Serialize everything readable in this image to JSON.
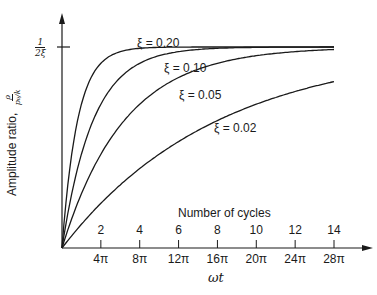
{
  "chart_data": {
    "type": "line",
    "title": "",
    "xlabel": "ωt",
    "x2label": "Number of cycles",
    "ylabel": "Amplitude ratio,",
    "ylabel_fraction": {
      "num": "ρ",
      "den": "p₀/k"
    },
    "ymax_label": {
      "num": "1",
      "den": "2ξ"
    },
    "x_ticks_cycles": [
      "2",
      "4",
      "6",
      "8",
      "10",
      "12",
      "14"
    ],
    "x_ticks_omega_t": [
      "4π",
      "8π",
      "12π",
      "16π",
      "20π",
      "24π",
      "28π"
    ],
    "x_range_cycles": [
      0,
      14
    ],
    "y_range_normalized": [
      0,
      1
    ],
    "grid": false,
    "legend": "inline labels",
    "formula": "ratio = (1/2ξ)(1 − e^(−ξωt))",
    "series": [
      {
        "name": "ξ = 0.20",
        "xi": 0.2,
        "cycles": [
          0,
          1,
          2,
          4,
          6,
          8,
          10,
          12,
          14
        ],
        "values_normalized": [
          0,
          0.72,
          0.92,
          0.99,
          1.0,
          1.0,
          1.0,
          1.0,
          1.0
        ]
      },
      {
        "name": "ξ = 0.10",
        "xi": 0.1,
        "cycles": [
          0,
          1,
          2,
          4,
          6,
          8,
          10,
          12,
          14
        ],
        "values_normalized": [
          0,
          0.47,
          0.72,
          0.92,
          0.98,
          0.99,
          1.0,
          1.0,
          1.0
        ]
      },
      {
        "name": "ξ = 0.05",
        "xi": 0.05,
        "cycles": [
          0,
          1,
          2,
          4,
          6,
          8,
          10,
          12,
          14
        ],
        "values_normalized": [
          0,
          0.27,
          0.47,
          0.72,
          0.85,
          0.92,
          0.96,
          0.98,
          0.99
        ]
      },
      {
        "name": "ξ = 0.02",
        "xi": 0.02,
        "cycles": [
          0,
          1,
          2,
          4,
          6,
          8,
          10,
          12,
          14
        ],
        "values_normalized": [
          0,
          0.12,
          0.22,
          0.4,
          0.53,
          0.63,
          0.72,
          0.78,
          0.83
        ]
      }
    ]
  },
  "labels": {
    "curve_020": "ξ = 0.20",
    "curve_010": "ξ = 0.10",
    "curve_005": "ξ = 0.05",
    "curve_002": "ξ = 0.02",
    "number_of_cycles": "Number of cycles",
    "omega_t": "ωt",
    "ylabel_text": "Amplitude ratio,",
    "ylabel_num": "ρ",
    "ylabel_den": "p₀/k",
    "ymax_num": "1",
    "ymax_den": "2ξ"
  }
}
